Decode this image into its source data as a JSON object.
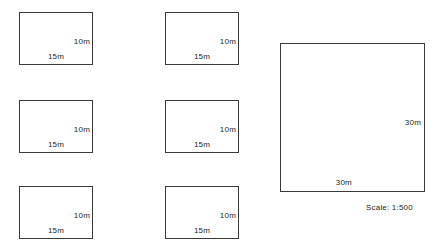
{
  "drawing": {
    "title": "Site plan of plots",
    "background_color": "#ffffff",
    "line_color": "#3a3a3a",
    "text_color": "#1c1c1c",
    "scale_note": "Scale: 1:500",
    "small_plots": [
      {
        "id": "plot-1",
        "column": 1,
        "row": 1,
        "x": 19,
        "y": 12,
        "width_label": "15m",
        "height_label": "10m"
      },
      {
        "id": "plot-2",
        "column": 2,
        "row": 1,
        "x": 165,
        "y": 12,
        "width_label": "15m",
        "height_label": "10m"
      },
      {
        "id": "plot-3",
        "column": 1,
        "row": 2,
        "x": 19,
        "y": 100,
        "width_label": "15m",
        "height_label": "10m"
      },
      {
        "id": "plot-4",
        "column": 2,
        "row": 2,
        "x": 165,
        "y": 100,
        "width_label": "15m",
        "height_label": "10m"
      },
      {
        "id": "plot-5",
        "column": 1,
        "row": 3,
        "x": 19,
        "y": 186,
        "width_label": "15m",
        "height_label": "10m"
      },
      {
        "id": "plot-6",
        "column": 2,
        "row": 3,
        "x": 165,
        "y": 186,
        "width_label": "15m",
        "height_label": "10m"
      }
    ],
    "large_plot": {
      "id": "plot-large",
      "x": 280,
      "y": 43,
      "width_label": "30m",
      "height_label": "30m"
    }
  }
}
